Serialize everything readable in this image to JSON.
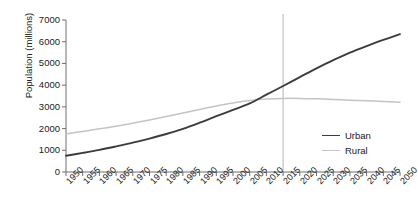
{
  "chart_data": {
    "type": "line",
    "title": "",
    "xlabel": "",
    "ylabel": "Population (millions)",
    "xlim": [
      1950,
      2050
    ],
    "ylim": [
      0,
      7000
    ],
    "grid": false,
    "legend_position": "right-lower",
    "x_ticks": [
      "1950",
      "1955",
      "1960",
      "1965",
      "1970",
      "1975",
      "1980",
      "1985",
      "1990",
      "1995",
      "2000",
      "2005",
      "2010",
      "2015",
      "2020",
      "2025",
      "2030",
      "2035",
      "2040",
      "2045",
      "2050"
    ],
    "y_ticks": [
      "0",
      "1000",
      "2000",
      "3000",
      "4000",
      "5000",
      "6000",
      "7000"
    ],
    "x": [
      1950,
      1955,
      1960,
      1965,
      1970,
      1975,
      1980,
      1985,
      1990,
      1995,
      2000,
      2005,
      2010,
      2015,
      2020,
      2025,
      2030,
      2035,
      2040,
      2045,
      2050
    ],
    "series": [
      {
        "name": "Urban",
        "color": "#3c3c3c",
        "values": [
          750,
          880,
          1020,
          1180,
          1350,
          1540,
          1750,
          1990,
          2270,
          2570,
          2860,
          3160,
          3560,
          3960,
          4370,
          4770,
          5150,
          5500,
          5800,
          6080,
          6350
        ]
      },
      {
        "name": "Rural",
        "color": "#c4c4c4",
        "values": [
          1750,
          1870,
          1990,
          2110,
          2250,
          2400,
          2560,
          2720,
          2880,
          3040,
          3180,
          3290,
          3360,
          3390,
          3390,
          3370,
          3340,
          3310,
          3280,
          3250,
          3210
        ]
      }
    ],
    "annotations": [
      {
        "name": "reference-line-2015",
        "type": "vline",
        "x": 2015,
        "color": "#b5b5b5"
      }
    ]
  },
  "legend": {
    "items": [
      {
        "label": "Urban",
        "color": "#3c3c3c"
      },
      {
        "label": "Rural",
        "color": "#c4c4c4"
      }
    ]
  },
  "axes": {
    "y_title": "Population (millions)",
    "axis_color": "#6e6e6e"
  }
}
